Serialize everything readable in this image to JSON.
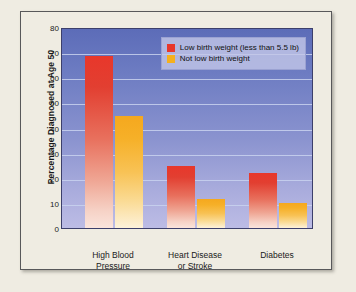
{
  "chart_data": {
    "type": "bar",
    "title": "",
    "xlabel": "",
    "ylabel": "Percentage Diagnosed at Age 50",
    "ylim": [
      0,
      80
    ],
    "yticks": [
      0,
      10,
      20,
      30,
      40,
      50,
      60,
      70,
      80
    ],
    "grid": true,
    "legend_position": "top-right",
    "categories": [
      "High Blood\nPressure",
      "Heart Disease\nor Stroke",
      "Diabetes"
    ],
    "category_lines": [
      [
        "High Blood",
        "Pressure"
      ],
      [
        "Heart Disease",
        "or Stroke"
      ],
      [
        "Diabetes",
        ""
      ]
    ],
    "series": [
      {
        "name": "Low birth weight (less than 5.5 lb)",
        "color": "#e8372b",
        "values": [
          69,
          25,
          22
        ]
      },
      {
        "name": "Not low birth weight",
        "color": "#f5b01e",
        "values": [
          45,
          11.5,
          10
        ]
      }
    ]
  },
  "colors": {
    "page_background": "#efece2",
    "frame_border": "#58585a",
    "plot_top": "#5c6cb8",
    "plot_bottom": "#bcbce5",
    "gridline": "#c9d2ee",
    "legend_background": "#c4c8e8",
    "bar_red": "#e8372b",
    "bar_yellow": "#f5b01e",
    "text": "#1a1a1a"
  }
}
